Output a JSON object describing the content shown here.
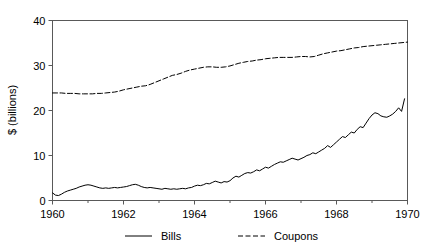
{
  "chart_data": {
    "type": "line",
    "title": "",
    "subtitle": "",
    "xlabel": "",
    "ylabel": "$ (billions)",
    "xlim": [
      1960,
      1970
    ],
    "ylim": [
      0,
      40
    ],
    "grid": false,
    "legend_position": "bottom",
    "x_ticks": [
      "1960",
      "1962",
      "1964",
      "1966",
      "1968",
      "1970"
    ],
    "x_tick_values": [
      1960,
      1962,
      1964,
      1966,
      1968,
      1970
    ],
    "x_minor_tick_values": [
      1961,
      1963,
      1965,
      1967,
      1969
    ],
    "y_ticks": [
      "0",
      "10",
      "20",
      "30",
      "40"
    ],
    "y_tick_values": [
      0,
      10,
      20,
      30,
      40
    ],
    "series": [
      {
        "name": "Bills",
        "style": "solid",
        "color": "#000000",
        "x": [
          1960.0,
          1960.083,
          1960.167,
          1960.25,
          1960.333,
          1960.417,
          1960.5,
          1960.583,
          1960.667,
          1960.75,
          1960.833,
          1960.917,
          1961.0,
          1961.083,
          1961.167,
          1961.25,
          1961.333,
          1961.417,
          1961.5,
          1961.583,
          1961.667,
          1961.75,
          1961.833,
          1961.917,
          1962.0,
          1962.083,
          1962.167,
          1962.25,
          1962.333,
          1962.417,
          1962.5,
          1962.583,
          1962.667,
          1962.75,
          1962.833,
          1962.917,
          1963.0,
          1963.083,
          1963.167,
          1963.25,
          1963.333,
          1963.417,
          1963.5,
          1963.583,
          1963.667,
          1963.75,
          1963.833,
          1963.917,
          1964.0,
          1964.083,
          1964.167,
          1964.25,
          1964.333,
          1964.417,
          1964.5,
          1964.583,
          1964.667,
          1964.75,
          1964.833,
          1964.917,
          1965.0,
          1965.083,
          1965.167,
          1965.25,
          1965.333,
          1965.417,
          1965.5,
          1965.583,
          1965.667,
          1965.75,
          1965.833,
          1965.917,
          1966.0,
          1966.083,
          1966.167,
          1966.25,
          1966.333,
          1966.417,
          1966.5,
          1966.583,
          1966.667,
          1966.75,
          1966.833,
          1966.917,
          1967.0,
          1967.083,
          1967.167,
          1967.25,
          1967.333,
          1967.417,
          1967.5,
          1967.583,
          1967.667,
          1967.75,
          1967.833,
          1967.917,
          1968.0,
          1968.083,
          1968.167,
          1968.25,
          1968.333,
          1968.417,
          1968.5,
          1968.583,
          1968.667,
          1968.75,
          1968.833,
          1968.917,
          1969.0,
          1969.083,
          1969.167,
          1969.25,
          1969.333,
          1969.417,
          1969.5,
          1969.583,
          1969.667,
          1969.75,
          1969.833,
          1969.917
        ],
        "values": [
          1.7,
          1.2,
          1.1,
          1.4,
          1.8,
          2.1,
          2.3,
          2.5,
          2.7,
          3.0,
          3.2,
          3.4,
          3.5,
          3.4,
          3.2,
          3.0,
          2.8,
          2.7,
          2.8,
          2.7,
          2.8,
          2.9,
          2.8,
          2.9,
          3.0,
          3.1,
          3.3,
          3.5,
          3.6,
          3.4,
          3.1,
          2.9,
          2.8,
          2.9,
          2.8,
          2.7,
          2.6,
          2.5,
          2.7,
          2.6,
          2.5,
          2.6,
          2.5,
          2.6,
          2.7,
          2.6,
          2.8,
          2.9,
          3.2,
          3.4,
          3.3,
          3.5,
          3.8,
          3.7,
          4.0,
          4.3,
          4.1,
          3.9,
          4.2,
          4.1,
          4.4,
          5.0,
          5.4,
          5.2,
          5.6,
          6.0,
          6.2,
          6.1,
          6.4,
          6.8,
          6.6,
          7.0,
          7.4,
          7.2,
          7.6,
          8.0,
          8.3,
          8.6,
          8.5,
          8.8,
          9.1,
          9.4,
          9.2,
          9.0,
          9.3,
          9.6,
          10.0,
          10.2,
          10.6,
          10.4,
          10.8,
          11.2,
          11.6,
          12.2,
          11.8,
          12.4,
          13.0,
          13.6,
          14.2,
          14.0,
          14.6,
          15.2,
          15.0,
          15.8,
          16.4,
          16.2,
          17.2,
          18.2,
          19.0,
          19.5,
          19.3,
          18.8,
          18.6,
          18.5,
          18.8,
          19.2,
          19.8,
          20.6,
          19.8,
          22.6
        ]
      },
      {
        "name": "Coupons",
        "style": "dashed",
        "color": "#000000",
        "x": [
          1960.0,
          1960.125,
          1960.25,
          1960.375,
          1960.5,
          1960.625,
          1960.75,
          1960.875,
          1961.0,
          1961.125,
          1961.25,
          1961.375,
          1961.5,
          1961.625,
          1961.75,
          1961.875,
          1962.0,
          1962.125,
          1962.25,
          1962.375,
          1962.5,
          1962.625,
          1962.75,
          1962.875,
          1963.0,
          1963.125,
          1963.25,
          1963.375,
          1963.5,
          1963.625,
          1963.75,
          1963.875,
          1964.0,
          1964.125,
          1964.25,
          1964.375,
          1964.5,
          1964.625,
          1964.75,
          1964.875,
          1965.0,
          1965.125,
          1965.25,
          1965.375,
          1965.5,
          1965.625,
          1965.75,
          1965.875,
          1966.0,
          1966.125,
          1966.25,
          1966.375,
          1966.5,
          1966.625,
          1966.75,
          1966.875,
          1967.0,
          1967.125,
          1967.25,
          1967.375,
          1967.5,
          1967.625,
          1967.75,
          1967.875,
          1968.0,
          1968.125,
          1968.25,
          1968.375,
          1968.5,
          1968.625,
          1968.75,
          1968.875,
          1969.0,
          1969.125,
          1969.25,
          1969.375,
          1969.5,
          1969.625,
          1969.75,
          1969.875,
          1970.0
        ],
        "values": [
          23.9,
          23.9,
          23.9,
          23.8,
          23.8,
          23.8,
          23.7,
          23.7,
          23.7,
          23.7,
          23.8,
          23.8,
          23.9,
          24.0,
          24.1,
          24.3,
          24.6,
          24.8,
          25.0,
          25.2,
          25.4,
          25.5,
          25.8,
          26.2,
          26.6,
          27.0,
          27.4,
          27.8,
          28.0,
          28.3,
          28.7,
          29.0,
          29.2,
          29.4,
          29.6,
          29.7,
          29.7,
          29.6,
          29.6,
          29.7,
          29.9,
          30.2,
          30.5,
          30.7,
          30.9,
          31.0,
          31.2,
          31.3,
          31.5,
          31.6,
          31.7,
          31.8,
          31.8,
          31.8,
          31.8,
          31.9,
          32.0,
          32.0,
          31.9,
          32.0,
          32.3,
          32.6,
          32.8,
          33.0,
          33.2,
          33.3,
          33.5,
          33.7,
          33.9,
          34.0,
          34.2,
          34.3,
          34.4,
          34.5,
          34.6,
          34.7,
          34.8,
          34.9,
          35.0,
          35.1,
          35.2
        ]
      }
    ]
  },
  "legend": {
    "items": [
      {
        "label": "Bills",
        "style": "solid"
      },
      {
        "label": "Coupons",
        "style": "dashed"
      }
    ]
  },
  "axes": {
    "y_title": "$ (billions)"
  }
}
